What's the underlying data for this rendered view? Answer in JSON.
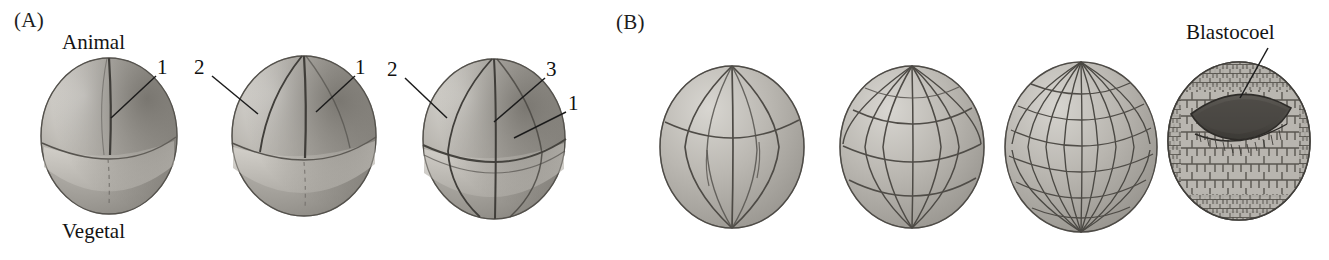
{
  "figure": {
    "background": "#ffffff",
    "ink": "#1a1a1a",
    "caption_font_style": "serif"
  },
  "panels": [
    {
      "id": "A",
      "letter": "(A)",
      "letter_pos": {
        "x": 14,
        "y": 10
      },
      "axis_labels": [
        {
          "name": "animal-pole-label",
          "text": "Animal",
          "x": 62,
          "y": 32
        },
        {
          "name": "vegetal-pole-label",
          "text": "Vegetal",
          "x": 62,
          "y": 222
        }
      ],
      "embryos": [
        {
          "name": "two-cell-embryo",
          "stage": "2-cell",
          "x": 38,
          "y": 55,
          "w": 140,
          "h": 160,
          "meridians": 1,
          "latitudes": 1,
          "labels": [
            {
              "text": "1",
              "lx": 160,
              "ly": 62,
              "tipx": 108,
              "tipy": 118
            }
          ]
        },
        {
          "name": "four-cell-embryo",
          "stage": "4-cell",
          "x": 228,
          "y": 52,
          "w": 150,
          "h": 165,
          "meridians": 2,
          "latitudes": 1,
          "labels": [
            {
              "text": "2",
              "lx": 199,
              "ly": 60,
              "tipx": 256,
              "tipy": 112
            },
            {
              "text": "1",
              "lx": 360,
              "ly": 60,
              "tipx": 318,
              "tipy": 110
            }
          ]
        },
        {
          "name": "eight-cell-embryo",
          "stage": "8-cell",
          "x": 418,
          "y": 55,
          "w": 150,
          "h": 165,
          "meridians": 2,
          "latitudes": 2,
          "labels": [
            {
              "text": "2",
              "lx": 392,
              "ly": 62,
              "tipx": 444,
              "tipy": 118
            },
            {
              "text": "3",
              "lx": 545,
              "ly": 62,
              "tipx": 492,
              "tipy": 125
            },
            {
              "text": "1",
              "lx": 572,
              "ly": 96,
              "tipx": 513,
              "tipy": 138
            }
          ]
        }
      ]
    },
    {
      "id": "B",
      "letter": "(B)",
      "letter_pos": {
        "x": 616,
        "y": 12
      },
      "axis_labels": [
        {
          "name": "blastocoel-label",
          "text": "Blastocoel",
          "x": 1186,
          "y": 22
        }
      ],
      "embryos": [
        {
          "name": "early-cleavage-embryo",
          "stage": "early cleavage",
          "x": 655,
          "y": 62,
          "w": 152,
          "h": 168,
          "meridians": 5,
          "latitudes": 1
        },
        {
          "name": "mid-cleavage-embryo",
          "stage": "mid cleavage",
          "x": 835,
          "y": 62,
          "w": 152,
          "h": 168,
          "meridians": 7,
          "latitudes": 4
        },
        {
          "name": "late-cleavage-embryo",
          "stage": "late cleavage",
          "x": 1000,
          "y": 58,
          "w": 160,
          "h": 176,
          "meridians": 11,
          "latitudes": 8
        },
        {
          "name": "blastula-section",
          "stage": "blastula (cut-away)",
          "x": 1165,
          "y": 60,
          "w": 148,
          "h": 162,
          "cavity": "blastocoel",
          "label": {
            "text": "Blastocoel",
            "lx": 1186,
            "ly": 22,
            "tipx": 1257,
            "tipy": 96
          }
        }
      ]
    }
  ],
  "legend_numbers": {
    "1": "first cleavage furrow",
    "2": "second cleavage furrow",
    "3": "third cleavage furrow"
  }
}
